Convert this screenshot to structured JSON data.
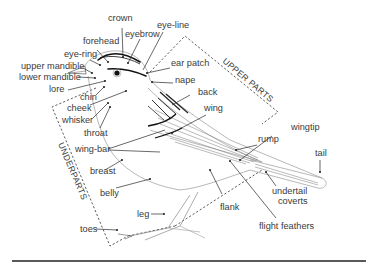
{
  "diagram": {
    "region_labels": {
      "upper": "UPPER PARTS",
      "under": "UNDERPARTS"
    },
    "labels": [
      {
        "id": "crown",
        "text": "crown"
      },
      {
        "id": "forehead",
        "text": "forehead"
      },
      {
        "id": "eyebrow",
        "text": "eyebrow"
      },
      {
        "id": "eye-line",
        "text": "eye-line"
      },
      {
        "id": "eye-ring",
        "text": "eye-ring"
      },
      {
        "id": "ear-patch",
        "text": "ear patch"
      },
      {
        "id": "upper-mandible",
        "text": "upper mandible"
      },
      {
        "id": "lower-mandible",
        "text": "lower mandible"
      },
      {
        "id": "nape",
        "text": "nape"
      },
      {
        "id": "lore",
        "text": "lore"
      },
      {
        "id": "back",
        "text": "back"
      },
      {
        "id": "chin",
        "text": "chin"
      },
      {
        "id": "cheek",
        "text": "cheek"
      },
      {
        "id": "wing",
        "text": "wing"
      },
      {
        "id": "whisker",
        "text": "whisker"
      },
      {
        "id": "throat",
        "text": "throat"
      },
      {
        "id": "wing-bar",
        "text": "wing-bar"
      },
      {
        "id": "rump",
        "text": "rump"
      },
      {
        "id": "wingtip",
        "text": "wingtip"
      },
      {
        "id": "tail",
        "text": "tail"
      },
      {
        "id": "breast",
        "text": "breast"
      },
      {
        "id": "belly",
        "text": "belly"
      },
      {
        "id": "undertail-coverts-1",
        "text": "undertail"
      },
      {
        "id": "undertail-coverts-2",
        "text": "coverts"
      },
      {
        "id": "flank",
        "text": "flank"
      },
      {
        "id": "leg",
        "text": "leg"
      },
      {
        "id": "toes",
        "text": "toes"
      },
      {
        "id": "flight-feathers",
        "text": "flight feathers"
      }
    ]
  }
}
